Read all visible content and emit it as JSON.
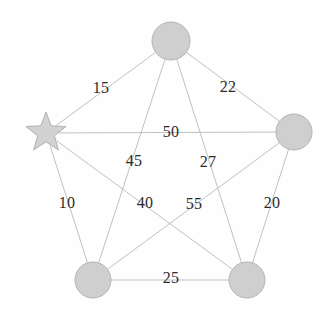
{
  "figure": {
    "background_color": "#fefefe",
    "width": 324,
    "height": 312
  },
  "style": {
    "node_fill": "#cfcfcf",
    "node_stroke": "#b4b4b4",
    "star_fill": "#d2d2d2",
    "star_stroke": "#b0b0b0",
    "edge_color": "#b9b9b9",
    "label_color": "#2b2b2b"
  },
  "chart_data": {
    "type": "diagram",
    "title": "",
    "xlabel": "",
    "ylabel": "",
    "graph_type": "complete-graph-k5",
    "node_count": 5,
    "edge_count": 10,
    "nodes": [
      {
        "id": "top",
        "label": "",
        "shape": "circle",
        "x": 171,
        "y": 41,
        "r": 19
      },
      {
        "id": "right",
        "label": "",
        "shape": "circle",
        "x": 294,
        "y": 132,
        "r": 18
      },
      {
        "id": "bottom-right",
        "label": "",
        "shape": "circle",
        "x": 247,
        "y": 280,
        "r": 18
      },
      {
        "id": "bottom-left",
        "label": "",
        "shape": "circle",
        "x": 93,
        "y": 280,
        "r": 18
      },
      {
        "id": "left-star",
        "label": "",
        "shape": "star",
        "x": 46,
        "y": 133,
        "r": 21
      }
    ],
    "edges": [
      {
        "from": "left-star",
        "to": "top",
        "weight": 15,
        "label_x": 101,
        "label_y": 88
      },
      {
        "from": "top",
        "to": "right",
        "weight": 22,
        "label_x": 228,
        "label_y": 87
      },
      {
        "from": "left-star",
        "to": "right",
        "weight": 50,
        "label_x": 171,
        "label_y": 132
      },
      {
        "from": "top",
        "to": "bottom-left",
        "weight": 45,
        "label_x": 134,
        "label_y": 161
      },
      {
        "from": "top",
        "to": "bottom-right",
        "weight": 27,
        "label_x": 208,
        "label_y": 162
      },
      {
        "from": "left-star",
        "to": "bottom-left",
        "weight": 10,
        "label_x": 67,
        "label_y": 203
      },
      {
        "from": "right",
        "to": "bottom-left",
        "weight": 40,
        "label_x": 145,
        "label_y": 203
      },
      {
        "from": "left-star",
        "to": "bottom-right",
        "weight": 55,
        "label_x": 194,
        "label_y": 204
      },
      {
        "from": "right",
        "to": "bottom-right",
        "weight": 20,
        "label_x": 272,
        "label_y": 203
      },
      {
        "from": "bottom-left",
        "to": "bottom-right",
        "weight": 25,
        "label_x": 171,
        "label_y": 278
      }
    ],
    "weights": [
      15,
      22,
      50,
      45,
      27,
      10,
      40,
      55,
      20,
      25
    ],
    "legend": []
  }
}
